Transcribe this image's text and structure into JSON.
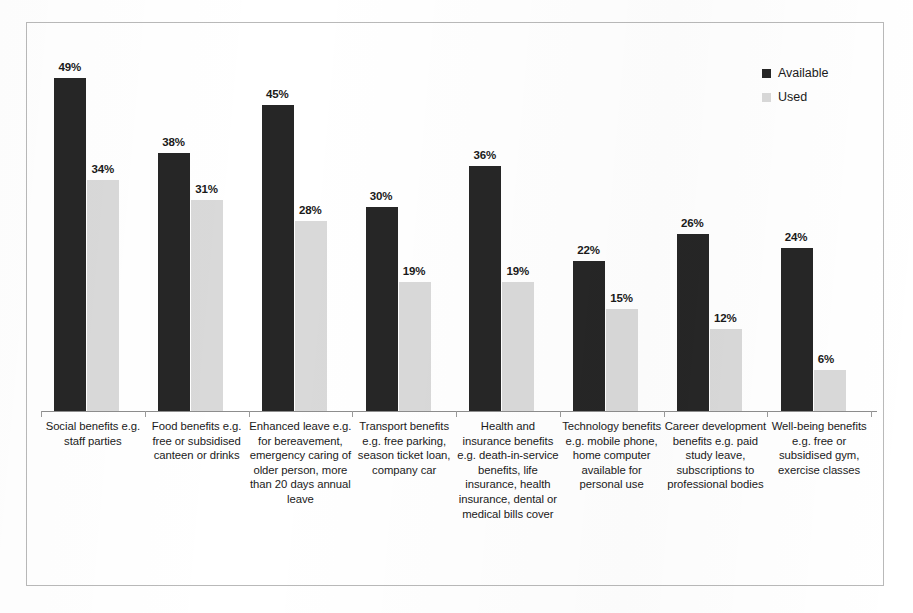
{
  "chart_data": {
    "type": "bar",
    "title": "",
    "subtitle": "",
    "xlabel": "",
    "ylabel": "",
    "ylim": [
      0,
      55
    ],
    "grid": false,
    "legend_position": "top-right",
    "value_suffix": "%",
    "categories": [
      "Social benefits e.g. staff parties",
      "Food benefits e.g. free or subsidised canteen or drinks",
      "Enhanced leave e.g. for bereavement, emergency caring of older person, more than 20 days annual leave",
      "Transport benefits e.g. free parking, season ticket loan, company car",
      "Health and insurance benefits e.g. death-in-service benefits, life insurance, health insurance, dental or medical bills cover",
      "Technology benefits e.g. mobile phone, home computer available for personal use",
      "Career development benefits e.g. paid study leave, subscriptions to professional bodies",
      "Well-being benefits e.g. free or subsidised gym, exercise classes"
    ],
    "series": [
      {
        "name": "Available",
        "color": "#262626",
        "values": [
          49,
          38,
          45,
          30,
          36,
          22,
          26,
          24
        ],
        "labels": [
          "49%",
          "38%",
          "45%",
          "30%",
          "36%",
          "22%",
          "26%",
          "24%"
        ]
      },
      {
        "name": "Used",
        "color": "#d9d9d9",
        "values": [
          34,
          31,
          28,
          19,
          19,
          15,
          12,
          6
        ],
        "labels": [
          "34%",
          "31%",
          "28%",
          "19%",
          "19%",
          "15%",
          "12%",
          "6%"
        ]
      }
    ]
  },
  "legend": {
    "items": [
      {
        "label": "Available",
        "color": "#262626"
      },
      {
        "label": "Used",
        "color": "#d9d9d9"
      }
    ]
  }
}
